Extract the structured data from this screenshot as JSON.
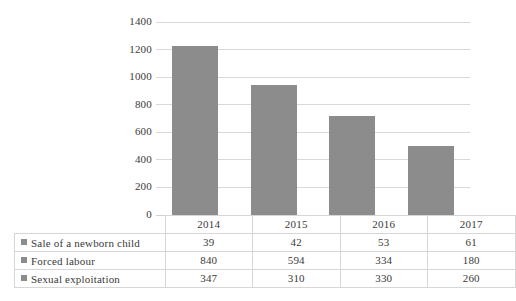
{
  "chart_data": {
    "type": "bar",
    "subtype": "stacked-column",
    "title": "",
    "xlabel": "",
    "ylabel": "",
    "categories": [
      "2014",
      "2015",
      "2016",
      "2017"
    ],
    "series": [
      {
        "name": "Sale of a newborn child",
        "values": [
          39,
          42,
          53,
          61
        ],
        "color": "#8c8c8c"
      },
      {
        "name": "Forced labour",
        "values": [
          840,
          594,
          334,
          180
        ],
        "color": "#8c8c8c"
      },
      {
        "name": "Sexual exploitation",
        "values": [
          347,
          310,
          330,
          260
        ],
        "color": "#8c8c8c"
      }
    ],
    "totals": [
      1226,
      946,
      717,
      501
    ],
    "ylim": [
      0,
      1400
    ],
    "ytick_labels": [
      "1400",
      "1200",
      "1000",
      "800",
      "600",
      "400",
      "200",
      "0"
    ],
    "ytick_values": [
      1400,
      1200,
      1000,
      800,
      600,
      400,
      200,
      0
    ],
    "ytick_step": 200,
    "grid": true,
    "legend_position": "data-table-left",
    "data_table_visible": true
  },
  "table": {
    "header": [
      "",
      "2014",
      "2015",
      "2016",
      "2017"
    ],
    "rows": [
      {
        "label": "Sale of a newborn child",
        "values": [
          "39",
          "42",
          "53",
          "61"
        ]
      },
      {
        "label": "Forced labour",
        "values": [
          "840",
          "594",
          "334",
          "180"
        ]
      },
      {
        "label": "Sexual exploitation",
        "values": [
          "347",
          "310",
          "330",
          "260"
        ]
      }
    ]
  },
  "style": {
    "bar_color": "#8c8c8c",
    "gridline_color": "#d9d9d9",
    "table_border_color": "#d6d6d6",
    "text_color": "#3a3a3a",
    "background": "#ffffff"
  }
}
